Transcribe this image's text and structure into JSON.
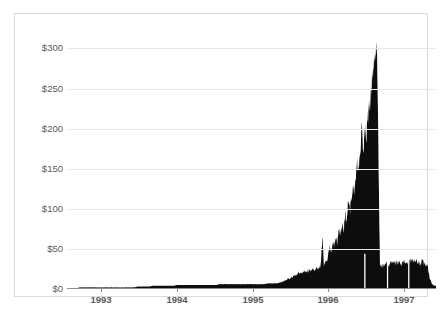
{
  "chart": {
    "title": "",
    "frame_color": "#d9d9d9",
    "grid_color": "#e8e8e8",
    "axis_color": "#8c8c8c",
    "series_color": "#0d0d0d"
  },
  "chart_data": {
    "type": "area",
    "title": "",
    "subtitle": "",
    "xlabel": "",
    "ylabel": "",
    "grid": true,
    "legend": "none",
    "xlim": [
      1992.55,
      1997.42
    ],
    "ylim": [
      0,
      318
    ],
    "y_ticks": [
      0,
      50,
      100,
      150,
      200,
      250,
      300
    ],
    "y_tick_labels": [
      "$0",
      "$50",
      "$100",
      "$150",
      "$200",
      "$250",
      "$300"
    ],
    "x_ticks": [
      1993,
      1994,
      1995,
      1996,
      1997
    ],
    "x_tick_labels": [
      "1993",
      "1994",
      "1995",
      "1996",
      "1997"
    ],
    "series": [
      {
        "name": "Price",
        "x": [
          1992.56,
          1992.6,
          1992.64,
          1992.68,
          1992.72,
          1992.76,
          1992.8,
          1992.84,
          1992.88,
          1992.92,
          1992.96,
          1993.0,
          1993.04,
          1993.08,
          1993.12,
          1993.16,
          1993.2,
          1993.24,
          1993.28,
          1993.32,
          1993.36,
          1993.4,
          1993.44,
          1993.48,
          1993.52,
          1993.56,
          1993.6,
          1993.64,
          1993.68,
          1993.72,
          1993.76,
          1993.8,
          1993.84,
          1993.88,
          1993.92,
          1993.96,
          1994.0,
          1994.04,
          1994.08,
          1994.12,
          1994.16,
          1994.2,
          1994.24,
          1994.28,
          1994.32,
          1994.36,
          1994.4,
          1994.44,
          1994.48,
          1994.52,
          1994.56,
          1994.6,
          1994.64,
          1994.68,
          1994.72,
          1994.76,
          1994.8,
          1994.84,
          1994.88,
          1994.92,
          1994.96,
          1995.0,
          1995.04,
          1995.08,
          1995.12,
          1995.16,
          1995.2,
          1995.24,
          1995.28,
          1995.32,
          1995.36,
          1995.4,
          1995.44,
          1995.48,
          1995.52,
          1995.56,
          1995.6,
          1995.64,
          1995.68,
          1995.72,
          1995.76,
          1995.8,
          1995.84,
          1995.88,
          1995.9,
          1995.92,
          1995.94,
          1995.96,
          1995.98,
          1996.0,
          1996.02,
          1996.04,
          1996.06,
          1996.08,
          1996.1,
          1996.12,
          1996.14,
          1996.16,
          1996.18,
          1996.2,
          1996.22,
          1996.24,
          1996.26,
          1996.28,
          1996.3,
          1996.32,
          1996.34,
          1996.36,
          1996.38,
          1996.4,
          1996.42,
          1996.44,
          1996.46,
          1996.48,
          1996.5,
          1996.52,
          1996.54,
          1996.56,
          1996.58,
          1996.6,
          1996.64,
          1996.68,
          1996.72,
          1996.76,
          1996.8,
          1996.84,
          1996.88,
          1996.92,
          1996.96,
          1997.0,
          1997.04,
          1997.08,
          1997.12,
          1997.16,
          1997.2,
          1997.24,
          1997.28,
          1997.31,
          1997.34,
          1997.37,
          1997.4
        ],
        "values": [
          1,
          1,
          1,
          1,
          2,
          2,
          2,
          2,
          2,
          2,
          2,
          2,
          2,
          2,
          2,
          2,
          2,
          2,
          2,
          2,
          2,
          2,
          2,
          3,
          3,
          3,
          3,
          3,
          4,
          4,
          4,
          4,
          4,
          4,
          4,
          4,
          5,
          5,
          5,
          5,
          5,
          5,
          5,
          5,
          5,
          5,
          5,
          5,
          5,
          5,
          6,
          6,
          6,
          6,
          6,
          6,
          6,
          6,
          6,
          6,
          6,
          6,
          6,
          6,
          6,
          6,
          7,
          7,
          7,
          7,
          8,
          9,
          11,
          13,
          15,
          17,
          19,
          20,
          21,
          22,
          23,
          24,
          25,
          26,
          28,
          65,
          30,
          32,
          34,
          44,
          52,
          48,
          58,
          54,
          62,
          58,
          70,
          66,
          78,
          74,
          86,
          92,
          100,
          96,
          110,
          122,
          118,
          140,
          152,
          148,
          168,
          200,
          176,
          202,
          190,
          212,
          228,
          242,
          258,
          280,
          305,
          30,
          28,
          32,
          30,
          34,
          31,
          33,
          30,
          35,
          32,
          36,
          33,
          35,
          31,
          34,
          30,
          28,
          12,
          6,
          4
        ]
      }
    ],
    "annotations": [
      {
        "label": "peak",
        "x": 1996.46,
        "y": 305
      },
      {
        "label": "crash",
        "x": 1996.48,
        "y": 30
      },
      {
        "label": "post-crash plateau",
        "x": 1996.9,
        "y": 32
      }
    ]
  },
  "y_axis": {
    "labels": [
      "$300",
      "$250",
      "$200",
      "$150",
      "$100",
      "$50",
      "$0"
    ]
  },
  "x_axis": {
    "labels": [
      "1993",
      "1994",
      "1995",
      "1996",
      "1997"
    ]
  }
}
